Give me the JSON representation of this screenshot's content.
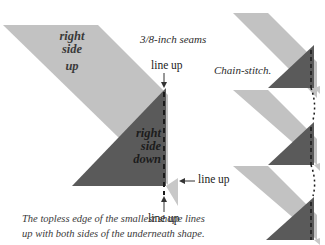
{
  "diagram": {
    "colors": {
      "light_fabric": "#c2c2c2",
      "dark_fabric": "#5a5a5a",
      "seam_line": "#1a1a1a",
      "text": "#2b2b2b"
    },
    "labels": {
      "right_side_up": [
        "right",
        "side",
        "up"
      ],
      "right_side_down": [
        "right",
        "side",
        "down"
      ],
      "seam_note": "3/8-inch seams",
      "line_up_top": "line up",
      "line_up_right": "line up",
      "line_up_bottom": "line up",
      "chain_stitch": "Chain-stitch.",
      "caption_line1": "The topless edge of the smallest shape lines",
      "caption_line2": "up with both sides of the underneath shape."
    },
    "chain_units": 3
  }
}
